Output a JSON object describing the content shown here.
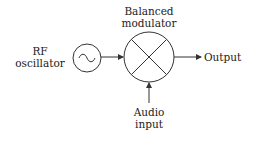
{
  "diagram": {
    "nodes": {
      "oscillator": {
        "label_line1": "RF",
        "label_line2": "oscillator",
        "symbol": "sine-wave"
      },
      "modulator": {
        "label_line1": "Balanced",
        "label_line2": "modulator",
        "symbol": "mixer-cross"
      },
      "audio": {
        "label_line1": "Audio",
        "label_line2": "input"
      },
      "output": {
        "label": "Output"
      }
    },
    "edges": [
      {
        "from": "oscillator",
        "to": "modulator"
      },
      {
        "from": "audio",
        "to": "modulator"
      },
      {
        "from": "modulator",
        "to": "output"
      }
    ],
    "colors": {
      "stroke": "#333333",
      "text": "#222222",
      "background": "#ffffff"
    }
  }
}
